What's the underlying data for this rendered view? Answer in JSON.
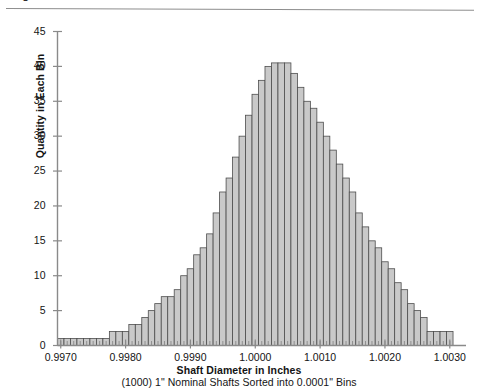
{
  "figure": {
    "top_caption_fragment": "Figure 9 — Shaft diameter distribution",
    "axis_color": "#8a8a8a",
    "bar_fill": "#c9c9c9",
    "bar_stroke": "#4d4d4d"
  },
  "chart_data": {
    "type": "bar",
    "title": "",
    "xlabel": "Shaft Diameter in Inches",
    "xsublabel": "(1000) 1\" Nominal Shafts Sorted into 0.0001\" Bins",
    "ylabel": "Quantity in Each Bin",
    "xlim": [
      0.99695,
      1.00325
    ],
    "ylim": [
      0,
      45
    ],
    "ytick_values": [
      0,
      5,
      10,
      15,
      20,
      25,
      30,
      35,
      40,
      45
    ],
    "ytick_labels": [
      "0",
      "5",
      "10",
      "15",
      "20",
      "25",
      "30",
      "35",
      "40",
      "45"
    ],
    "xtick_values": [
      0.997,
      0.998,
      0.999,
      1.0,
      1.001,
      1.002,
      1.003
    ],
    "xtick_labels": [
      "0.9970",
      "0.9980",
      "0.9990",
      "1.0000",
      "1.0010",
      "1.0020",
      "1.0030"
    ],
    "minor_xtick_step": 0.0001,
    "grid": false,
    "legend": null,
    "bin_width": 0.0001,
    "categories": [
      0.997,
      0.9971,
      0.9972,
      0.9973,
      0.9974,
      0.9975,
      0.9976,
      0.9977,
      0.9978,
      0.9979,
      0.998,
      0.9981,
      0.9982,
      0.9983,
      0.9984,
      0.9985,
      0.9986,
      0.9987,
      0.9988,
      0.9989,
      0.999,
      0.9991,
      0.9992,
      0.9993,
      0.9994,
      0.9995,
      0.9996,
      0.9997,
      0.9998,
      0.9999,
      1.0,
      1.0001,
      1.0002,
      1.0003,
      1.0004,
      1.0005,
      1.0006,
      1.0007,
      1.0008,
      1.0009,
      1.001,
      1.0011,
      1.0012,
      1.0013,
      1.0014,
      1.0015,
      1.0016,
      1.0017,
      1.0018,
      1.0019,
      1.002,
      1.0021,
      1.0022,
      1.0023,
      1.0024,
      1.0025,
      1.0026,
      1.0027,
      1.0028,
      1.0029,
      1.003
    ],
    "values": [
      1,
      1,
      1,
      1,
      1,
      1,
      1,
      1,
      2,
      2,
      2,
      3,
      3,
      4,
      5,
      6,
      7,
      7,
      8,
      10,
      11,
      13,
      14,
      16,
      19,
      22,
      24,
      27,
      30,
      33,
      36,
      38,
      40,
      40.5,
      40.5,
      40.5,
      39,
      37,
      35,
      34,
      32,
      30,
      28,
      26,
      24,
      22,
      19,
      17,
      15,
      14,
      12,
      11,
      9,
      8,
      6,
      5,
      4,
      2,
      2,
      2,
      2
    ]
  }
}
